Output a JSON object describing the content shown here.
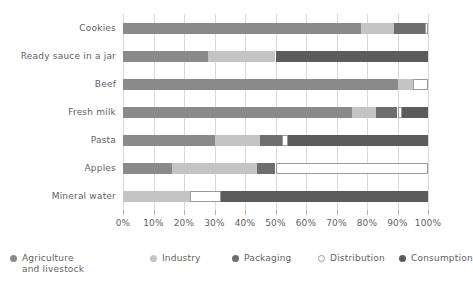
{
  "chart_data": {
    "type": "bar",
    "orientation": "horizontal",
    "stacked": true,
    "normalized": true,
    "title": "",
    "xlabel": "",
    "ylabel": "",
    "xlim": [
      0,
      100
    ],
    "grid": true,
    "legend_position": "bottom",
    "xticks": [
      0,
      10,
      20,
      30,
      40,
      50,
      60,
      70,
      80,
      90,
      100
    ],
    "xticklabels": [
      "0%",
      "10%",
      "20%",
      "30%",
      "40%",
      "50%",
      "60%",
      "70%",
      "80%",
      "90%",
      "100%"
    ],
    "categories": [
      "Cookies",
      "Ready sauce in a jar",
      "Beef",
      "Fresh milk",
      "Pasta",
      "Apples",
      "Mineral water"
    ],
    "series": [
      {
        "name": "Agriculture and livestock",
        "color": "#8a8a8a",
        "values": [
          78,
          28,
          90,
          75,
          30,
          16,
          0
        ]
      },
      {
        "name": "Industry",
        "color": "#c4c4c4",
        "values": [
          11,
          22,
          5,
          8,
          15,
          28,
          22
        ]
      },
      {
        "name": "Packaging",
        "color": "#6e6e6e",
        "values": [
          10,
          0,
          0,
          7,
          7,
          6,
          0
        ]
      },
      {
        "name": "Distribution",
        "color": "#ffffff",
        "values": [
          1,
          0,
          5,
          1.5,
          2,
          50,
          10
        ]
      },
      {
        "name": "Consumption",
        "color": "#5c5c5c",
        "values": [
          0,
          50,
          0,
          8.5,
          46,
          0,
          68
        ]
      }
    ]
  },
  "legend": {
    "items": [
      {
        "label": "Agriculture\nand livestock",
        "color": "#8a8a8a",
        "hollow": false
      },
      {
        "label": "Industry",
        "color": "#c4c4c4",
        "hollow": false
      },
      {
        "label": "Packaging",
        "color": "#6e6e6e",
        "hollow": false
      },
      {
        "label": "Distribution",
        "color": "#ffffff",
        "hollow": true
      },
      {
        "label": "Consumption",
        "color": "#5c5c5c",
        "hollow": false
      }
    ]
  },
  "colors": {
    "agriculture": "#8a8a8a",
    "industry": "#c4c4c4",
    "packaging": "#6e6e6e",
    "distribution": "#ffffff",
    "consumption": "#5c5c5c",
    "grid": "#d9d9d9",
    "text": "#5f5f5f",
    "background": "#ffffff"
  }
}
